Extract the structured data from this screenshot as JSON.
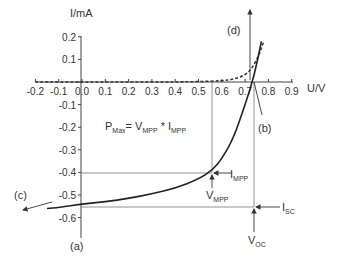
{
  "chart_data": {
    "type": "line",
    "title": "",
    "xlabel": "U/V",
    "ylabel": "I/mA",
    "xlim": [
      -0.2,
      0.9
    ],
    "ylim": [
      -0.6,
      0.2
    ],
    "x_ticks": [
      "-0.2",
      "-0.1",
      "0.0",
      "0.1",
      "0.2",
      "0.3",
      "0.4",
      "0.5",
      "0.6",
      "0.7",
      "0.8",
      "0.9"
    ],
    "y_ticks": [
      "0.2",
      "0.1",
      "0.0",
      "-0.1",
      "-0.2",
      "-0.3",
      "-0.4",
      "-0.5",
      "-0.6"
    ],
    "grid": false,
    "series": [
      {
        "name": "illuminated I-V curve",
        "style": "solid",
        "x": [
          -0.15,
          -0.1,
          0.0,
          0.1,
          0.2,
          0.3,
          0.4,
          0.5,
          0.56,
          0.6,
          0.65,
          0.7,
          0.74,
          0.77
        ],
        "y": [
          -0.56,
          -0.555,
          -0.54,
          -0.53,
          -0.515,
          -0.495,
          -0.47,
          -0.43,
          -0.39,
          -0.34,
          -0.25,
          -0.1,
          0.03,
          0.18
        ]
      },
      {
        "name": "dark I-V curve",
        "style": "dashed",
        "x": [
          -0.2,
          0.0,
          0.2,
          0.4,
          0.5,
          0.6,
          0.65,
          0.7,
          0.73,
          0.76,
          0.78
        ],
        "y": [
          0.0,
          0.0,
          0.0,
          0.0,
          0.002,
          0.005,
          0.012,
          0.03,
          0.06,
          0.12,
          0.18
        ]
      }
    ],
    "annotations": {
      "formula": {
        "p": "P",
        "p_sub": "Max",
        "eq": "= V",
        "v_sub": "MPP",
        "mul": " * I",
        "i_sub": "MPP"
      },
      "mpp": {
        "x": 0.56,
        "y": -0.39,
        "v_label": "V",
        "v_sub": "MPP",
        "i_label": "I",
        "i_sub": "MPP"
      },
      "voc": {
        "x": 0.74,
        "label": "V",
        "sub": "OC"
      },
      "isc": {
        "y": -0.54,
        "label": "I",
        "sub": "SC"
      },
      "labels": {
        "a": "(a)",
        "b": "(b)",
        "c": "(c)",
        "d": "(d)"
      }
    }
  }
}
